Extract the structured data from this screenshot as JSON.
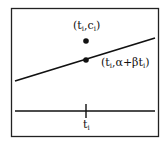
{
  "diagram": {
    "point_label_prefix": "(t",
    "point_label": "(t_i, c_i)",
    "line_point_label": "(t_i, α+βt_i)",
    "axis_label": "t_i",
    "labels": {
      "pt_t": "(t",
      "pt_i1": "i",
      "pt_c": ",c",
      "pt_i2": "i",
      "pt_close": ")",
      "ln_t": "(t",
      "ln_i1": "i",
      "ln_mid": ",α+βt",
      "ln_i2": "i",
      "ln_close": ")",
      "ax_t": "t",
      "ax_i": "i"
    },
    "colors": {
      "stroke": "#111111",
      "background": "#ffffff"
    }
  }
}
